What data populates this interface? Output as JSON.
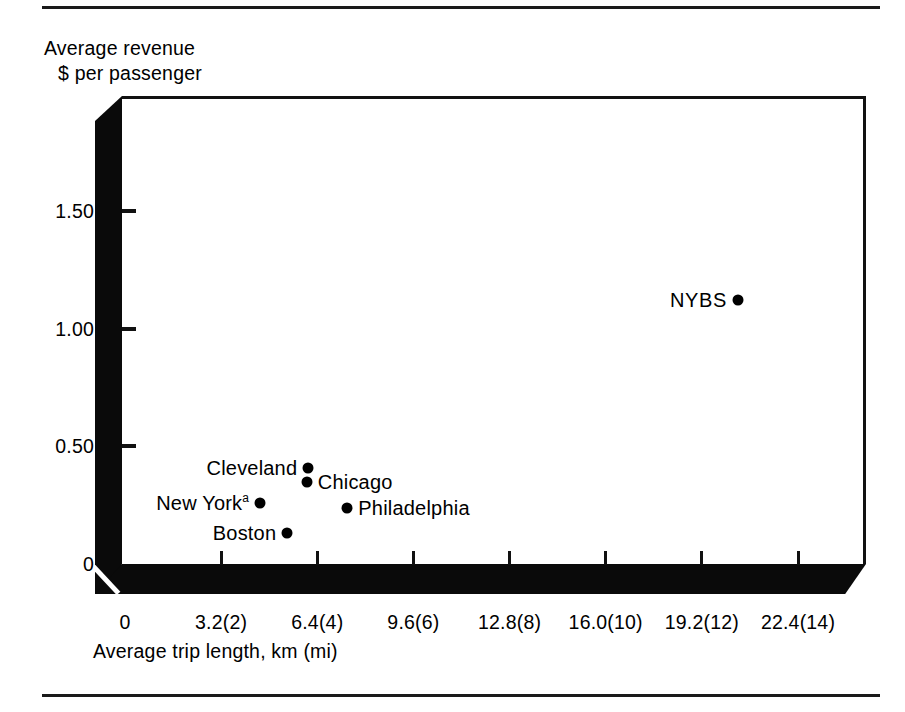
{
  "figure": {
    "axes": {
      "ylabel_line1": "Average revenue",
      "ylabel_line2": "$ per passenger",
      "xlabel": "Average trip length, km (mi)"
    },
    "rules": {
      "top": "horizontal-rule",
      "bottom": "horizontal-rule"
    }
  },
  "chart_data": {
    "type": "scatter",
    "title": "",
    "xlabel": "Average trip length, km (mi)",
    "ylabel": "Average revenue $ per passenger",
    "xlim": [
      0,
      23.5
    ],
    "ylim": [
      0,
      1.85
    ],
    "grid": false,
    "legend": "none",
    "xticks": [
      0,
      3.2,
      6.4,
      9.6,
      12.8,
      16.0,
      19.2,
      22.4
    ],
    "xticklabels": [
      "0",
      "3.2(2)",
      "6.4(4)",
      "9.6(6)",
      "12.8(8)",
      "16.0(10)",
      "19.2(12)",
      "22.4(14)"
    ],
    "yticks": [
      0,
      0.5,
      1.0,
      1.5
    ],
    "yticklabels": [
      "0",
      "0.50",
      "1.00",
      "1.50"
    ],
    "points": [
      {
        "name": "Cleveland",
        "label": "Cleveland",
        "label_sup": "",
        "x": 6.1,
        "y": 0.41,
        "label_side": "left"
      },
      {
        "name": "Chicago",
        "label": "Chicago",
        "label_sup": "",
        "x": 6.05,
        "y": 0.35,
        "label_side": "right"
      },
      {
        "name": "New York",
        "label": "New York",
        "label_sup": "a",
        "x": 4.5,
        "y": 0.26,
        "label_side": "left"
      },
      {
        "name": "Philadelphia",
        "label": "Philadelphia",
        "label_sup": "",
        "x": 7.4,
        "y": 0.24,
        "label_side": "right"
      },
      {
        "name": "Boston",
        "label": "Boston",
        "label_sup": "",
        "x": 5.4,
        "y": 0.13,
        "label_side": "left"
      },
      {
        "name": "NYBS",
        "label": "NYBS",
        "label_sup": "",
        "x": 20.4,
        "y": 1.12,
        "label_side": "left"
      }
    ],
    "footnote_marker": "a"
  }
}
